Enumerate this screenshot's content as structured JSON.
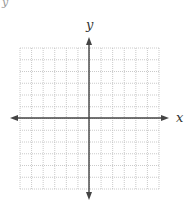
{
  "diagram": {
    "type": "coordinate-plane",
    "x_axis_label": "x",
    "y_axis_label": "y",
    "corner_glyph": "y",
    "grid": {
      "columns": 12,
      "rows": 12,
      "left": 20,
      "top": 48,
      "right": 159,
      "bottom": 189,
      "line_style": "dotted",
      "line_color": "#bdbdbd"
    },
    "axes": {
      "origin_x": 89,
      "origin_y": 118,
      "color": "#444444",
      "x_arrow_left": 10,
      "x_arrow_right": 169,
      "y_arrow_top": 37,
      "y_arrow_bottom": 200
    }
  }
}
